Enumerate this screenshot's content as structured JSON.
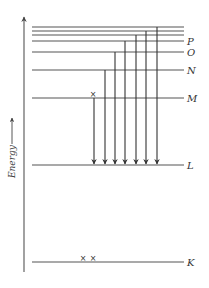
{
  "diagram": {
    "type": "energy-level-diagram",
    "axis_label": "Energy",
    "axis_arrow": "⟶",
    "levels": [
      {
        "name": "K",
        "label": "K",
        "y": 262
      },
      {
        "name": "L",
        "label": "L",
        "y": 165
      },
      {
        "name": "M",
        "label": "M",
        "y": 98
      },
      {
        "name": "N",
        "label": "N",
        "y": 70
      },
      {
        "name": "O",
        "label": "O",
        "y": 52
      },
      {
        "name": "P",
        "label": "P",
        "y": 41
      },
      {
        "name": "upper-1",
        "label": "",
        "y": 35
      },
      {
        "name": "upper-2",
        "label": "",
        "y": 31
      },
      {
        "name": "upper-3",
        "label": "",
        "y": 27
      }
    ],
    "transitions_to_L": [
      {
        "from": "M",
        "x": 94
      },
      {
        "from": "N",
        "x": 105
      },
      {
        "from": "O",
        "x": 115
      },
      {
        "from": "P",
        "x": 125
      },
      {
        "from": "upper-1",
        "x": 136
      },
      {
        "from": "upper-2",
        "x": 146
      },
      {
        "from": "upper-3",
        "x": 157
      }
    ],
    "vacancy_marks": [
      {
        "level": "M",
        "symbol": "×",
        "x": 93,
        "y": 95
      },
      {
        "level": "K",
        "symbol": "×",
        "x": 83,
        "y": 259
      },
      {
        "level": "K",
        "symbol": "×",
        "x": 93,
        "y": 259
      }
    ]
  }
}
